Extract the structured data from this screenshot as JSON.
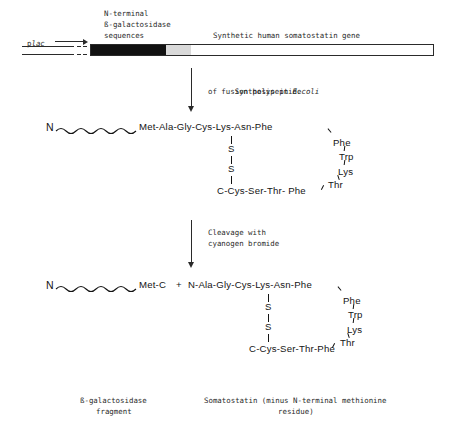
{
  "gene_construct": {
    "promoter_label_p": "p",
    "promoter_label_lac": "lac",
    "nterminal_label_line1": "N-terminal",
    "nterminal_label_line2": "ß-galactosidase",
    "nterminal_label_line3": "sequences",
    "gene_label": "Synthetic human somatostatin gene"
  },
  "step1": {
    "line1_prefix": "Synthesis in ",
    "line1_italic": "E.coli",
    "line2": "of fusion polypeptide"
  },
  "step2": {
    "line1": "Cleavage with",
    "line2": "cyanogen bromide"
  },
  "peptide1": {
    "n_terminus": "N",
    "main_chain": "Met-Ala-Gly-Cys-Lys-Asn-Phe",
    "bridge_s_top": "S",
    "bridge_s_bottom": "S",
    "bottom_chain": "C-Cys-Ser-Thr- Phe",
    "loop": [
      "Phe",
      "Trp",
      "Lys",
      "Thr"
    ]
  },
  "peptide2": {
    "n_terminus": "N",
    "fragment_tail": "Met-C",
    "plus_sign": "+",
    "second_n_terminus": "N",
    "main_chain": "-Ala-Gly-Cys-Lys-Asn-Phe",
    "bridge_s_top": "S",
    "bridge_s_bottom": "S",
    "bottom_chain": "C-Cys-Ser-Thr-Phe",
    "loop": [
      "Phe",
      "Trp",
      "Lys",
      "Thr"
    ]
  },
  "captions": {
    "left_line1": "ß-galactosidase",
    "left_line2": "fragment",
    "right_line1": "Somatostatin (minus N-terminal methionine",
    "right_line2": "residue)"
  },
  "colors": {
    "ink": "#1a1a1a",
    "bar_dark": "#111111",
    "bar_light": "#fefefe",
    "bar_stroke": "#2a2a2a"
  }
}
